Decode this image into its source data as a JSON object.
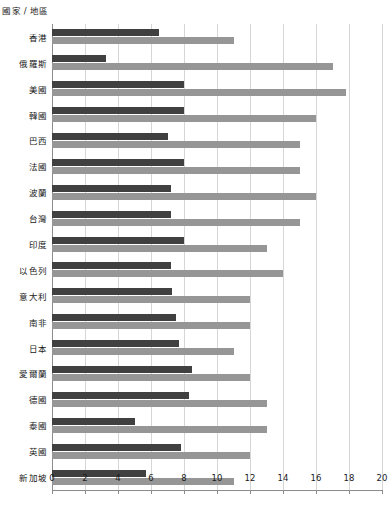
{
  "chart_data": {
    "type": "bar",
    "orientation": "horizontal",
    "title": "",
    "subtitle": "",
    "xlabel": "",
    "ylabel": "國家 / 地區",
    "category_header": "國家 / 地區",
    "xlim": [
      0,
      20
    ],
    "xticks": [
      0,
      2,
      4,
      6,
      8,
      10,
      12,
      14,
      16,
      18,
      20
    ],
    "xticklabels": [
      "0",
      "2",
      "4",
      "6",
      "8",
      "10",
      "12",
      "14",
      "16",
      "18",
      "20"
    ],
    "grid": true,
    "grid_axis": "x",
    "legend": false,
    "legend_position": "none",
    "colors": {
      "series_a": "#404040",
      "series_b": "#969696",
      "gridline": "#d6d6d6",
      "axis": "#8c8c8c",
      "text": "#1a1a1a",
      "background": "#ffffff"
    },
    "categories": [
      "香港",
      "俄羅斯",
      "美國",
      "韓國",
      "巴西",
      "法國",
      "波蘭",
      "台灣",
      "印度",
      "以色列",
      "意大利",
      "南非",
      "日本",
      "愛爾蘭",
      "德國",
      "泰國",
      "英國",
      "新加坡"
    ],
    "series": [
      {
        "name": "series_a",
        "color": "#404040",
        "values": [
          6.5,
          3.3,
          8.0,
          8.0,
          7.0,
          8.0,
          7.2,
          7.2,
          8.0,
          7.2,
          7.3,
          7.5,
          7.7,
          8.5,
          8.3,
          5.0,
          7.8,
          5.7
        ]
      },
      {
        "name": "series_b",
        "color": "#969696",
        "values": [
          11.0,
          17.0,
          17.8,
          16.0,
          15.0,
          15.0,
          16.0,
          15.0,
          13.0,
          14.0,
          12.0,
          12.0,
          11.0,
          12.0,
          13.0,
          13.0,
          12.0,
          11.0
        ]
      }
    ]
  }
}
